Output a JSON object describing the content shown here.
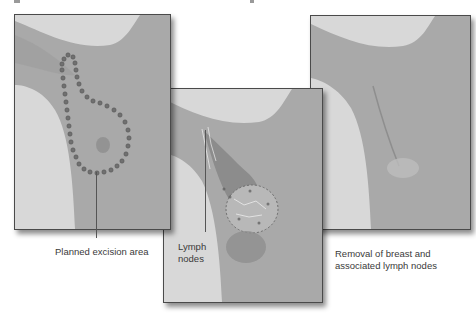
{
  "figure": {
    "panels": [
      {
        "id": "planned-excision",
        "description": "Torso with arm raised; dotted line outlines the breast and extends into the armpit",
        "caption_lines": [
          "Planned excision area"
        ]
      },
      {
        "id": "lymph-node-removal",
        "description": "Breast tissue and lymph nodes being removed, shown with a surgical overlay",
        "caption_lines": [
          "Lymph",
          "nodes"
        ]
      },
      {
        "id": "post-surgery",
        "description": "Chest after mastectomy showing a healed surgical scar",
        "caption_lines": [
          "Removal of breast and",
          "associated lymph nodes"
        ]
      }
    ],
    "colors": {
      "background": "#ffffff",
      "skin_tone_gray": "#a8a8a8",
      "backdrop_gray": "#dcdcdc",
      "dots": "#6a6a6a",
      "frame": "#4a4a4a",
      "caption_text": "#3a3a3a"
    }
  }
}
